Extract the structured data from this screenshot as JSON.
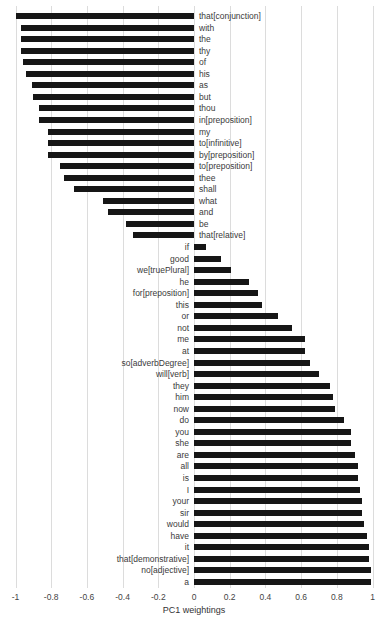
{
  "chart_data": {
    "type": "bar",
    "orientation": "horizontal",
    "title": "",
    "xlabel": "PC1 weightings",
    "ylabel": "",
    "xlim": [
      -1,
      1
    ],
    "xticks": [
      "-1",
      "-0.8",
      "-0.6",
      "-0.4",
      "-0.2",
      "0",
      "0.2",
      "0.4",
      "0.6",
      "0.8",
      "1"
    ],
    "grid": "vertical",
    "legend": "none",
    "bar_color": "#161616",
    "categories": [
      "that[conjunction]",
      "with",
      "the",
      "thy",
      "of",
      "his",
      "as",
      "but",
      "thou",
      "in[preposition]",
      "my",
      "to[infinitive]",
      "by[preposition]",
      "to[preposition]",
      "thee",
      "shall",
      "what",
      "and",
      "be",
      "that[relative]",
      "if",
      "good",
      "we[truePlural]",
      "he",
      "for[preposition]",
      "this",
      "or",
      "not",
      "me",
      "at",
      "so[adverbDegree]",
      "will[verb]",
      "they",
      "him",
      "now",
      "do",
      "you",
      "she",
      "are",
      "all",
      "is",
      "I",
      "your",
      "sir",
      "would",
      "have",
      "it",
      "that[demonstrative]",
      "no[adjective]",
      "a"
    ],
    "values": [
      -1.0,
      -0.97,
      -0.97,
      -0.97,
      -0.96,
      -0.94,
      -0.91,
      -0.9,
      -0.87,
      -0.87,
      -0.82,
      -0.82,
      -0.82,
      -0.75,
      -0.73,
      -0.67,
      -0.51,
      -0.48,
      -0.38,
      -0.34,
      0.07,
      0.15,
      0.21,
      0.31,
      0.36,
      0.38,
      0.47,
      0.55,
      0.62,
      0.62,
      0.65,
      0.7,
      0.76,
      0.78,
      0.79,
      0.84,
      0.88,
      0.88,
      0.9,
      0.92,
      0.92,
      0.93,
      0.94,
      0.94,
      0.95,
      0.97,
      0.98,
      0.98,
      0.99,
      0.99
    ]
  }
}
